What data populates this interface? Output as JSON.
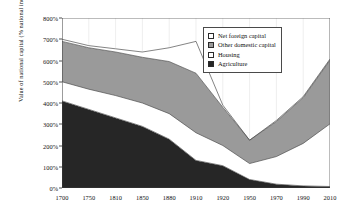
{
  "chart_data": {
    "type": "area",
    "stacked": true,
    "title": "",
    "xlabel": "",
    "ylabel": "Value of national capital (% national income)",
    "categories": [
      "1700",
      "1750",
      "1810",
      "1850",
      "1880",
      "1910",
      "1920",
      "1950",
      "1970",
      "1990",
      "2010"
    ],
    "x": [
      1700,
      1750,
      1810,
      1850,
      1880,
      1910,
      1920,
      1950,
      1970,
      1990,
      2010
    ],
    "ylim": [
      0,
      800
    ],
    "ytick_labels": [
      "0%",
      "100%",
      "200%",
      "300%",
      "400%",
      "500%",
      "600%",
      "700%",
      "800%"
    ],
    "ytick_values": [
      0,
      100,
      200,
      300,
      400,
      500,
      600,
      700,
      800
    ],
    "grid": "vertical-faint",
    "legend_position": "top-right",
    "series": [
      {
        "name": "Agriculture",
        "color": "#262626",
        "values": [
          410,
          370,
          330,
          290,
          230,
          130,
          105,
          40,
          18,
          10,
          7
        ]
      },
      {
        "name": "Housing",
        "color": "#ffffff",
        "values": [
          90,
          95,
          105,
          110,
          120,
          130,
          95,
          75,
          130,
          200,
          295
        ]
      },
      {
        "name": "Other domestic capital",
        "color": "#9a9a9a",
        "values": [
          190,
          195,
          205,
          215,
          245,
          280,
          180,
          110,
          165,
          215,
          300
        ]
      },
      {
        "name": "Net foreign capital",
        "color": "#ffffff",
        "values": [
          10,
          10,
          15,
          25,
          65,
          150,
          10,
          0,
          5,
          5,
          5
        ]
      }
    ],
    "totals": [
      700,
      670,
      655,
      640,
      660,
      690,
      390,
      225,
      318,
      430,
      607
    ],
    "annotations": []
  },
  "legend": {
    "items": [
      {
        "label": "Net foreign capital",
        "swatch": "white"
      },
      {
        "label": "Other domestic capital",
        "swatch": "gray"
      },
      {
        "label": "Housing",
        "swatch": "white"
      },
      {
        "label": "Agriculture",
        "swatch": "black"
      }
    ]
  }
}
